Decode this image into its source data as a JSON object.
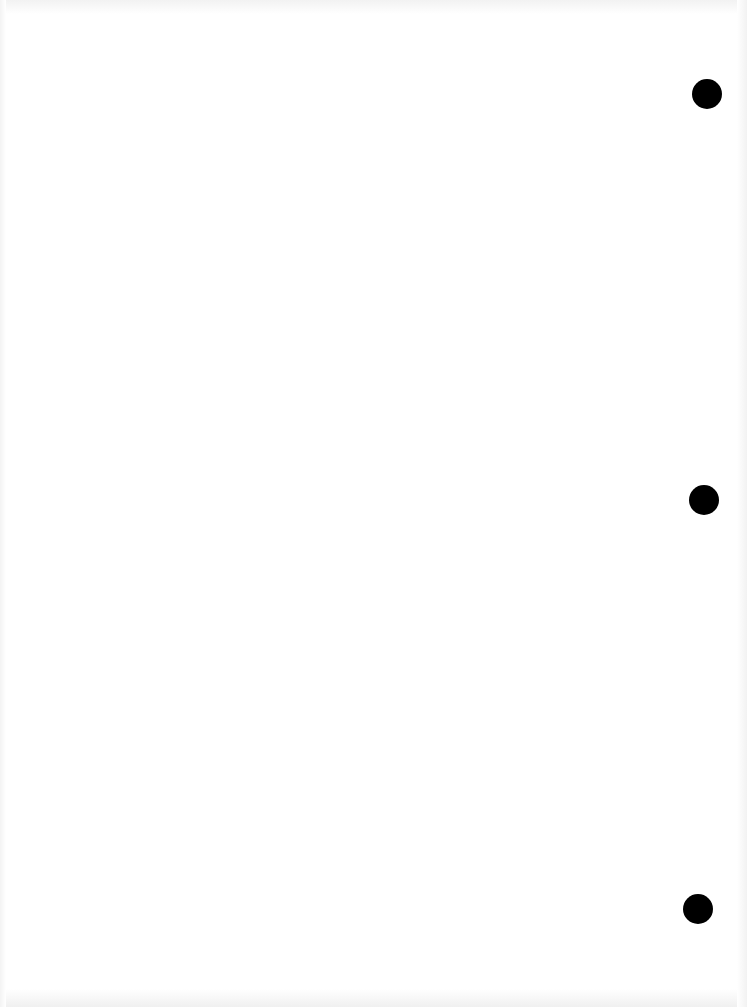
{
  "page": {
    "type": "blank scanned sheet",
    "background": "#ffffff",
    "punch_holes": [
      {
        "x": 692,
        "y": 79
      },
      {
        "x": 689,
        "y": 485
      },
      {
        "x": 683,
        "y": 894
      }
    ]
  }
}
